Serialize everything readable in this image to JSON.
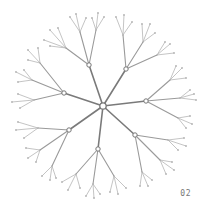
{
  "figure": {
    "label": "02",
    "colors": {
      "background": "#ffffff",
      "trunk": "#7a7a7a",
      "branch": "#9a9a9a",
      "twig": "#b5b5b5",
      "node_fill": "#ffffff",
      "node_stroke": "#777777"
    },
    "root": {
      "x": 103,
      "y": 106,
      "r": 3.2
    },
    "branches": [
      {
        "x": 89,
        "y": 65,
        "children": [
          {
            "x": 66,
            "y": 48,
            "leaves": [
              [
                50,
                30
              ],
              [
                58,
                28
              ],
              [
                44,
                40
              ],
              [
                50,
                46
              ]
            ]
          },
          {
            "x": 80,
            "y": 32,
            "leaves": [
              [
                70,
                17
              ],
              [
                76,
                14
              ],
              [
                86,
                18
              ]
            ]
          },
          {
            "x": 96,
            "y": 30,
            "leaves": [
              [
                98,
                13
              ],
              [
                104,
                17
              ],
              [
                92,
                18
              ]
            ]
          }
        ]
      },
      {
        "x": 126,
        "y": 69,
        "children": [
          {
            "x": 123,
            "y": 35,
            "leaves": [
              [
                116,
                17
              ],
              [
                124,
                15
              ],
              [
                132,
                22
              ]
            ]
          },
          {
            "x": 143,
            "y": 42,
            "leaves": [
              [
                142,
                24
              ],
              [
                150,
                24
              ],
              [
                155,
                33
              ]
            ]
          },
          {
            "x": 157,
            "y": 55,
            "leaves": [
              [
                170,
                44
              ],
              [
                174,
                53
              ],
              [
                165,
                42
              ]
            ]
          }
        ]
      },
      {
        "x": 64,
        "y": 93,
        "children": [
          {
            "x": 40,
            "y": 63,
            "leaves": [
              [
                28,
                50
              ],
              [
                38,
                48
              ],
              [
                28,
                60
              ]
            ]
          },
          {
            "x": 32,
            "y": 80,
            "leaves": [
              [
                16,
                72
              ],
              [
                18,
                82
              ],
              [
                24,
                70
              ]
            ]
          },
          {
            "x": 34,
            "y": 100,
            "leaves": [
              [
                18,
                94
              ],
              [
                12,
                102
              ],
              [
                20,
                108
              ]
            ]
          }
        ]
      },
      {
        "x": 146,
        "y": 101,
        "children": [
          {
            "x": 170,
            "y": 80,
            "leaves": [
              [
                182,
                68
              ],
              [
                186,
                78
              ],
              [
                176,
                66
              ]
            ]
          },
          {
            "x": 180,
            "y": 98,
            "leaves": [
              [
                194,
                94
              ],
              [
                196,
                100
              ],
              [
                190,
                90
              ]
            ]
          },
          {
            "x": 178,
            "y": 118,
            "leaves": [
              [
                190,
                116
              ],
              [
                192,
                124
              ],
              [
                186,
                128
              ]
            ]
          }
        ]
      },
      {
        "x": 69,
        "y": 130,
        "children": [
          {
            "x": 38,
            "y": 128,
            "leaves": [
              [
                18,
                122
              ],
              [
                16,
                130
              ],
              [
                24,
                138
              ]
            ]
          },
          {
            "x": 40,
            "y": 150,
            "leaves": [
              [
                26,
                148
              ],
              [
                28,
                158
              ],
              [
                36,
                162
              ]
            ]
          },
          {
            "x": 52,
            "y": 166,
            "leaves": [
              [
                42,
                176
              ],
              [
                50,
                180
              ],
              [
                56,
                178
              ]
            ]
          }
        ]
      },
      {
        "x": 135,
        "y": 135,
        "children": [
          {
            "x": 168,
            "y": 140,
            "leaves": [
              [
                184,
                138
              ],
              [
                186,
                146
              ],
              [
                178,
                150
              ]
            ]
          },
          {
            "x": 160,
            "y": 160,
            "leaves": [
              [
                172,
                162
              ],
              [
                174,
                170
              ],
              [
                166,
                174
              ]
            ]
          },
          {
            "x": 142,
            "y": 172,
            "leaves": [
              [
                140,
                186
              ],
              [
                148,
                186
              ],
              [
                152,
                180
              ]
            ]
          }
        ]
      },
      {
        "x": 98,
        "y": 149,
        "children": [
          {
            "x": 76,
            "y": 174,
            "leaves": [
              [
                62,
                182
              ],
              [
                68,
                190
              ],
              [
                80,
                188
              ]
            ]
          },
          {
            "x": 93,
            "y": 184,
            "leaves": [
              [
                86,
                196
              ],
              [
                94,
                198
              ],
              [
                100,
                194
              ]
            ]
          },
          {
            "x": 114,
            "y": 176,
            "leaves": [
              [
                110,
                192
              ],
              [
                118,
                194
              ],
              [
                126,
                188
              ]
            ]
          }
        ]
      }
    ]
  }
}
